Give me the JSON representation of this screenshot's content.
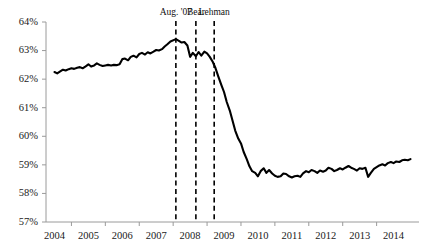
{
  "chart_data": {
    "type": "line",
    "title": "",
    "xlabel": "",
    "ylabel": "",
    "ylim": [
      57,
      64
    ],
    "xlim": [
      2003.75,
      2014.75
    ],
    "grid": false,
    "legend": null,
    "y_tick_labels": [
      "57%",
      "58%",
      "59%",
      "60%",
      "61%",
      "62%",
      "63%",
      "64%"
    ],
    "y_tick_values": [
      57,
      58,
      59,
      60,
      61,
      62,
      63,
      64
    ],
    "x_tick_labels": [
      "2004",
      "2005",
      "2006",
      "2007",
      "2008",
      "2009",
      "2010",
      "2011",
      "2012",
      "2013",
      "2014"
    ],
    "x_tick_values": [
      2004,
      2005,
      2006,
      2007,
      2008,
      2009,
      2010,
      2011,
      2012,
      2013,
      2014
    ],
    "series": [
      {
        "name": "participation-rate",
        "color": "#000000",
        "x": [
          2004.0,
          2004.08,
          2004.17,
          2004.25,
          2004.33,
          2004.42,
          2004.5,
          2004.58,
          2004.67,
          2004.75,
          2004.83,
          2004.92,
          2005.0,
          2005.08,
          2005.17,
          2005.25,
          2005.33,
          2005.42,
          2005.5,
          2005.58,
          2005.67,
          2005.75,
          2005.83,
          2005.92,
          2006.0,
          2006.08,
          2006.17,
          2006.25,
          2006.33,
          2006.42,
          2006.5,
          2006.58,
          2006.67,
          2006.75,
          2006.83,
          2006.92,
          2007.0,
          2007.08,
          2007.17,
          2007.25,
          2007.33,
          2007.42,
          2007.58,
          2007.67,
          2007.75,
          2007.83,
          2007.92,
          2008.0,
          2008.08,
          2008.17,
          2008.25,
          2008.33,
          2008.42,
          2008.5,
          2008.58,
          2008.67,
          2008.75,
          2008.83,
          2008.92,
          2009.0,
          2009.08,
          2009.17,
          2009.25,
          2009.33,
          2009.42,
          2009.5,
          2009.58,
          2009.67,
          2009.75,
          2009.83,
          2009.92,
          2010.0,
          2010.08,
          2010.17,
          2010.25,
          2010.33,
          2010.42,
          2010.5,
          2010.58,
          2010.67,
          2010.75,
          2010.83,
          2010.92,
          2011.0,
          2011.08,
          2011.17,
          2011.25,
          2011.33,
          2011.42,
          2011.5,
          2011.58,
          2011.67,
          2011.75,
          2011.83,
          2011.92,
          2012.0,
          2012.08,
          2012.17,
          2012.25,
          2012.33,
          2012.42,
          2012.5,
          2012.58,
          2012.67,
          2012.75,
          2012.83,
          2012.92,
          2013.0,
          2013.08,
          2013.17,
          2013.25,
          2013.33,
          2013.42,
          2013.5,
          2013.58,
          2013.67,
          2013.75,
          2013.83,
          2013.92,
          2014.0,
          2014.08,
          2014.17,
          2014.25,
          2014.33,
          2014.42,
          2014.5
        ],
        "values": [
          62.25,
          62.2,
          62.27,
          62.33,
          62.3,
          62.35,
          62.38,
          62.36,
          62.4,
          62.42,
          62.38,
          62.45,
          62.52,
          62.44,
          62.48,
          62.55,
          62.5,
          62.46,
          62.48,
          62.5,
          62.48,
          62.5,
          62.49,
          62.52,
          62.7,
          62.72,
          62.66,
          62.78,
          62.82,
          62.76,
          62.88,
          62.92,
          62.86,
          62.94,
          62.9,
          62.96,
          63.02,
          63.0,
          63.05,
          63.14,
          63.22,
          63.32,
          63.4,
          63.34,
          63.28,
          63.3,
          63.18,
          62.78,
          62.92,
          62.8,
          62.95,
          62.82,
          62.96,
          62.9,
          62.78,
          62.6,
          62.38,
          62.1,
          61.8,
          61.55,
          61.2,
          60.9,
          60.55,
          60.2,
          59.92,
          59.75,
          59.45,
          59.2,
          58.95,
          58.78,
          58.72,
          58.6,
          58.78,
          58.88,
          58.72,
          58.82,
          58.7,
          58.62,
          58.58,
          58.6,
          58.7,
          58.68,
          58.6,
          58.56,
          58.6,
          58.62,
          58.58,
          58.7,
          58.78,
          58.74,
          58.82,
          58.78,
          58.72,
          58.8,
          58.76,
          58.8,
          58.9,
          58.86,
          58.78,
          58.82,
          58.88,
          58.84,
          58.9,
          58.96,
          58.9,
          58.86,
          58.8,
          58.88,
          58.86,
          58.9,
          58.58,
          58.72,
          58.86,
          58.92,
          58.98,
          59.02,
          58.98,
          59.06,
          59.1,
          59.06,
          59.12,
          59.1,
          59.16,
          59.18,
          59.16,
          59.2
        ]
      }
    ],
    "annotations": [
      {
        "label": "Aug. '07",
        "x": 2007.58,
        "type": "vertical-dashed-line"
      },
      {
        "label": "Bear",
        "x": 2008.17,
        "type": "vertical-dashed-line"
      },
      {
        "label": "Lehman",
        "x": 2008.71,
        "type": "vertical-dashed-line"
      }
    ]
  }
}
